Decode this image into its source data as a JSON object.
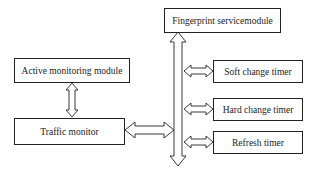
{
  "diagram": {
    "nodes": {
      "fingerprint": "Fingerprint servicemodule",
      "active": "Active monitoring module",
      "traffic": "Traffic monitor",
      "soft": "Soft change timer",
      "hard": "Hard change timer",
      "refresh": "Refresh timer"
    },
    "edges": [
      {
        "from": "active",
        "to": "traffic",
        "type": "bidirectional"
      },
      {
        "from": "traffic",
        "to": "bus",
        "type": "bidirectional"
      },
      {
        "from": "bus",
        "to": "soft",
        "type": "bidirectional"
      },
      {
        "from": "bus",
        "to": "hard",
        "type": "bidirectional"
      },
      {
        "from": "bus",
        "to": "refresh",
        "type": "bidirectional"
      },
      {
        "from": "bus",
        "to": "fingerprint",
        "type": "bidirectional"
      }
    ],
    "line_color": "#222222"
  }
}
